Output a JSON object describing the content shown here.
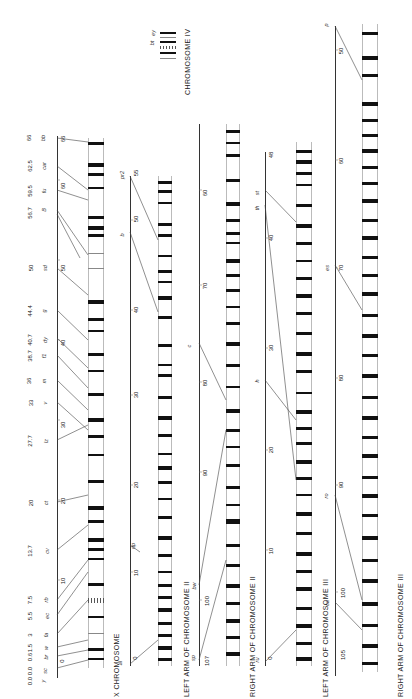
{
  "figure": {
    "orientation": "rotated -90deg (read bottom-to-top)",
    "panels": [
      {
        "id": "x",
        "title": "X CHROMOSOME",
        "scale_ticks": [
          "0",
          "10",
          "20",
          "30",
          "40",
          "50",
          "60",
          "66"
        ],
        "loci": [
          {
            "pos": "0.0",
            "name": "y"
          },
          {
            "pos": "0.0",
            "name": "sc"
          },
          {
            "pos": "0.6",
            "name": "br"
          },
          {
            "pos": "1.5",
            "name": "w"
          },
          {
            "pos": "3",
            "name": "fa"
          },
          {
            "pos": "5.5",
            "name": "ec"
          },
          {
            "pos": "7.5",
            "name": "rb"
          },
          {
            "pos": "13.7",
            "name": "cv"
          },
          {
            "pos": "20",
            "name": "ct"
          },
          {
            "pos": "27.7",
            "name": "lz"
          },
          {
            "pos": "33",
            "name": "v"
          },
          {
            "pos": "36",
            "name": "m"
          },
          {
            "pos": "38.7",
            "name": "f1"
          },
          {
            "pos": "40.7",
            "name": "dy"
          },
          {
            "pos": "44.4",
            "name": "g"
          },
          {
            "pos": "50",
            "name": "sd"
          },
          {
            "pos": "56.7",
            "name": "f"
          },
          {
            "pos": "57",
            "name": "B"
          },
          {
            "pos": "59.5",
            "name": "fu"
          },
          {
            "pos": "62.5",
            "name": "car"
          },
          {
            "pos": "66",
            "name": "bb"
          }
        ],
        "band_annotations": [
          "Bx",
          "pn",
          "ec",
          "fa",
          "w",
          "sp",
          "ct",
          "bt",
          "v",
          "sd",
          "dp"
        ]
      },
      {
        "id": "2L",
        "title": "LEFT ARM OF CHROMOSOME II",
        "scale_ticks": [
          "0",
          "10",
          "20",
          "30",
          "40",
          "50",
          "55"
        ],
        "loci": [
          {
            "pos": "0",
            "name": "al"
          },
          {
            "pos": "13",
            "name": "dp"
          },
          {
            "pos": "48.5",
            "name": "b"
          },
          {
            "pos": "54.5",
            "name": "pr"
          },
          {
            "pos": "55",
            "name": "pr2"
          }
        ]
      },
      {
        "id": "2R",
        "title": "RIGHT ARM OF CHROMOSOME II",
        "scale_ticks": [
          "60",
          "70",
          "80",
          "90",
          "100",
          "107"
        ],
        "loci": [
          {
            "pos": "67",
            "name": "vg"
          },
          {
            "pos": "75.5",
            "name": "c"
          },
          {
            "pos": "99",
            "name": "bw"
          },
          {
            "pos": "107",
            "name": "sp"
          }
        ]
      },
      {
        "id": "3L",
        "title": "LEFT ARM OF CHROMOSOME III",
        "scale_ticks": [
          "0",
          "10",
          "20",
          "30",
          "40",
          "48"
        ],
        "loci": [
          {
            "pos": "0",
            "name": "ru"
          },
          {
            "pos": "26",
            "name": "h"
          },
          {
            "pos": "44",
            "name": "th"
          },
          {
            "pos": "45",
            "name": "st"
          }
        ]
      },
      {
        "id": "3R",
        "title": "RIGHT ARM OF CHROMOSOME III",
        "scale_ticks": [
          "50",
          "60",
          "70",
          "80",
          "90",
          "100",
          "105"
        ],
        "loci": [
          {
            "pos": "48",
            "name": "p"
          },
          {
            "pos": "70.7",
            "name": "es"
          },
          {
            "pos": "91",
            "name": "ro"
          },
          {
            "pos": "100.7",
            "name": "ca"
          }
        ]
      },
      {
        "id": "4",
        "title": "CHROMOSOME IV",
        "loci": [
          {
            "pos": "",
            "name": "ey"
          },
          {
            "pos": "",
            "name": "bt"
          }
        ]
      }
    ]
  }
}
